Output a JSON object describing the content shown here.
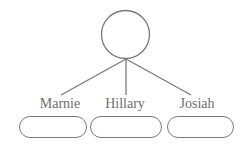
{
  "diagram": {
    "type": "tree",
    "root": {
      "label": "",
      "shape": "circle"
    },
    "children": [
      {
        "label": "Marnie",
        "input_value": ""
      },
      {
        "label": "Hillary",
        "input_value": ""
      },
      {
        "label": "Josiah",
        "input_value": ""
      }
    ],
    "colors": {
      "line": "#7a7a7a",
      "text": "#6e6e6e",
      "background": "#ffffff"
    }
  }
}
